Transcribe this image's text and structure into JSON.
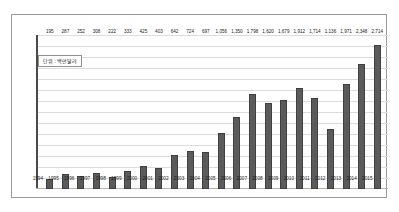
{
  "annotation": {
    "unit_note": "단위 : 백만달러"
  },
  "chart_data": {
    "type": "bar",
    "title": "",
    "subtitle": "",
    "xlabel": "",
    "ylabel": "",
    "unit_label": "단위 : 백만달러",
    "grid": true,
    "legend": "none",
    "ylim": [
      0,
      2900
    ],
    "bar_color": "#5b5b5b",
    "bar_edge_color": "#3f3f3f",
    "gridline_color": "#dcdcdc",
    "axis_color": "#4a4a4a",
    "categories": [
      "1994",
      "1995",
      "1996",
      "1997",
      "1998",
      "1999",
      "2000",
      "2001",
      "2002",
      "2003",
      "2004",
      "2005",
      "2006",
      "2007",
      "2008",
      "2009",
      "2010",
      "2011",
      "2012",
      "2013",
      "2014",
      "2015"
    ],
    "values": [
      195,
      287,
      252,
      308,
      222,
      333,
      425,
      403,
      642,
      724,
      697,
      1056,
      1350,
      1798,
      1620,
      1679,
      1912,
      1714,
      1136,
      1971,
      2348,
      2714
    ],
    "data_labels": [
      "195",
      "287",
      "252",
      "308",
      "222",
      "333",
      "425",
      "403",
      "642",
      "724",
      "697",
      "1,056",
      "1,350",
      "1,798",
      "1,620",
      "1,679",
      "1,912",
      "1,714",
      "1,136",
      "1,971",
      "2,348",
      "2,714"
    ]
  }
}
